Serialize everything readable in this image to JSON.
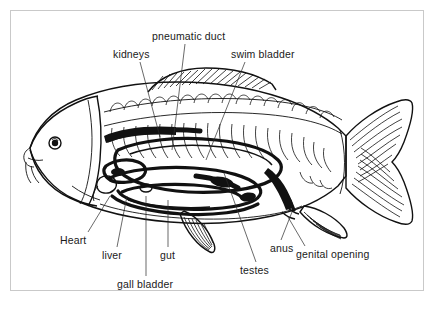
{
  "figure": {
    "kind": "anatomical-diagram",
    "species_shown": "carp-like bony fish, lateral cutaway view",
    "frame_color": "#c9c9c9",
    "ink_color": "#111111",
    "background_color": "#ffffff"
  },
  "labels": [
    {
      "id": "pneumatic-duct",
      "text": "pneumatic duct",
      "x": 152,
      "y": 30,
      "align": "left"
    },
    {
      "id": "kidneys",
      "text": "kidneys",
      "x": 113,
      "y": 48,
      "align": "left"
    },
    {
      "id": "swim-bladder",
      "text": "swim bladder",
      "x": 231,
      "y": 48,
      "align": "left"
    },
    {
      "id": "heart",
      "text": "Heart",
      "x": 60,
      "y": 234,
      "align": "left"
    },
    {
      "id": "liver",
      "text": "liver",
      "x": 102,
      "y": 249,
      "align": "left"
    },
    {
      "id": "gut",
      "text": "gut",
      "x": 160,
      "y": 249,
      "align": "left"
    },
    {
      "id": "gall-bladder",
      "text": "gall bladder",
      "x": 117,
      "y": 278,
      "align": "left"
    },
    {
      "id": "testes",
      "text": "testes",
      "x": 240,
      "y": 264,
      "align": "left"
    },
    {
      "id": "anus",
      "text": "anus",
      "x": 270,
      "y": 242,
      "align": "left"
    },
    {
      "id": "genital-opening",
      "text": "genital opening",
      "x": 296,
      "y": 248,
      "align": "left"
    }
  ],
  "leader_lines": [
    {
      "id": "pneumatic-duct-leader",
      "from": [
        185,
        44
      ],
      "to": [
        172,
        150
      ]
    },
    {
      "id": "kidneys-leader",
      "from": [
        140,
        62
      ],
      "to": [
        160,
        137
      ]
    },
    {
      "id": "swim-bladder-leader",
      "from": [
        245,
        62
      ],
      "to": [
        206,
        160
      ]
    },
    {
      "id": "heart-leader",
      "from": [
        88,
        232
      ],
      "to": [
        110,
        196
      ]
    },
    {
      "id": "liver-leader",
      "from": [
        117,
        247
      ],
      "to": [
        127,
        196
      ]
    },
    {
      "id": "gut-leader",
      "from": [
        168,
        247
      ],
      "to": [
        168,
        200
      ]
    },
    {
      "id": "gall-bladder-leader",
      "from": [
        146,
        276
      ],
      "to": [
        146,
        196
      ]
    },
    {
      "id": "testes-leader",
      "from": [
        256,
        262
      ],
      "to": [
        224,
        173
      ]
    },
    {
      "id": "anus-leader",
      "from": [
        281,
        240
      ],
      "to": [
        292,
        212
      ]
    },
    {
      "id": "genital-opening-leader",
      "from": [
        305,
        246
      ],
      "to": [
        288,
        217
      ]
    }
  ],
  "fish_parts": [
    {
      "id": "body-outline",
      "name": "fish body outline"
    },
    {
      "id": "head",
      "name": "head"
    },
    {
      "id": "eye",
      "name": "eye"
    },
    {
      "id": "barbels",
      "name": "mouth barbels"
    },
    {
      "id": "operculum",
      "name": "gill cover"
    },
    {
      "id": "dorsal-fin",
      "name": "dorsal fin"
    },
    {
      "id": "caudal-fin",
      "name": "caudal (tail) fin"
    },
    {
      "id": "anal-fin",
      "name": "anal fin"
    },
    {
      "id": "pelvic-fin",
      "name": "pelvic fin"
    },
    {
      "id": "vertebrae",
      "name": "vertebral column and ribs"
    },
    {
      "id": "swim-bladder-organ",
      "name": "swim bladder"
    },
    {
      "id": "kidney-organ",
      "name": "kidneys"
    },
    {
      "id": "gut-coil",
      "name": "intestine coil"
    },
    {
      "id": "liver-organ",
      "name": "liver"
    },
    {
      "id": "heart-organ",
      "name": "heart"
    },
    {
      "id": "testes-organ",
      "name": "testes"
    }
  ]
}
